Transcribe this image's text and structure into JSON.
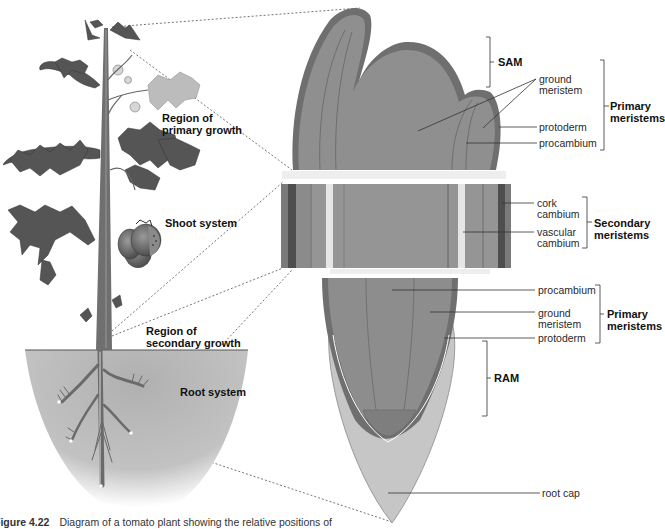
{
  "plant": {
    "labels": {
      "region_primary": "Region of\nprimary growth",
      "region_primary_1": "Region of",
      "region_primary_2": "primary growth",
      "shoot_system": "Shoot system",
      "region_secondary_1": "Region of",
      "region_secondary_2": "secondary growth",
      "root_system": "Root system"
    }
  },
  "shoot_tip": {
    "bracket_label": "SAM",
    "ground_meristem_1": "ground",
    "ground_meristem_2": "meristem",
    "protoderm": "protoderm",
    "procambium": "procambium",
    "group_label_1": "Primary",
    "group_label_2": "meristems"
  },
  "stem_section": {
    "cork_cambium_1": "cork",
    "cork_cambium_2": "cambium",
    "vascular_cambium_1": "vascular",
    "vascular_cambium_2": "cambium",
    "group_label_1": "Secondary",
    "group_label_2": "meristems"
  },
  "root_tip": {
    "procambium": "procambium",
    "ground_meristem_1": "ground",
    "ground_meristem_2": "meristem",
    "protoderm": "protoderm",
    "group_label_1": "Primary",
    "group_label_2": "meristems",
    "bracket_label": "RAM",
    "root_cap": "root cap"
  },
  "caption": {
    "figure_number": "Figure 4.22",
    "text": "Diagram of a tomato plant showing the relative positions of"
  },
  "colors": {
    "tissue_mid": "#8e8e8e",
    "tissue_dark": "#6a6a6a",
    "tissue_darkest": "#4a4a4a",
    "root_cap": "#c4c4c4",
    "soil": "#b8b8b8",
    "leaf": "#555555"
  }
}
